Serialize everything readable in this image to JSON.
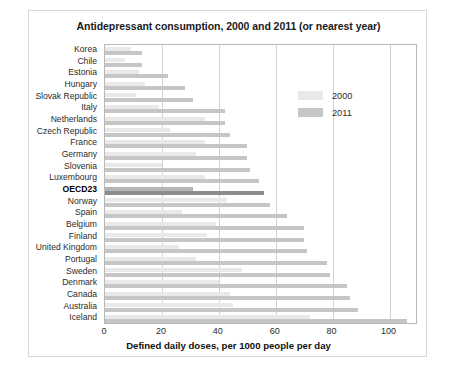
{
  "chart_data": {
    "type": "bar",
    "orientation": "horizontal",
    "title": "Antidepressant consumption, 2000 and 2011 (or nearest year)",
    "xlabel": "Defined daily doses, per 1000 people per day",
    "ylabel": "",
    "xlim": [
      0,
      110
    ],
    "xticks": [
      0,
      20,
      40,
      60,
      80,
      100
    ],
    "grid": "vertical",
    "legend_position": "upper-right-inside",
    "highlight_category": "OECD23",
    "categories": [
      "Korea",
      "Chile",
      "Estonia",
      "Hungary",
      "Slovak Republic",
      "Italy",
      "Netherlands",
      "Czech Republic",
      "France",
      "Germany",
      "Slovenia",
      "Luxembourg",
      "OECD23",
      "Norway",
      "Spain",
      "Belgium",
      "Finland",
      "United Kingdom",
      "Portugal",
      "Sweden",
      "Denmark",
      "Canada",
      "Australia",
      "Iceland"
    ],
    "series": [
      {
        "name": "2000",
        "color": "#e9e9e9",
        "values": [
          9,
          7,
          12,
          14,
          11,
          19,
          35,
          23,
          35,
          32,
          20,
          35,
          31,
          43,
          27,
          39,
          36,
          26,
          32,
          48,
          40,
          44,
          45,
          72
        ]
      },
      {
        "name": "2011",
        "color": "#c6c6c6",
        "values": [
          13,
          13,
          22,
          28,
          31,
          42,
          42,
          44,
          50,
          50,
          51,
          54,
          56,
          58,
          64,
          70,
          70,
          71,
          78,
          79,
          85,
          86,
          89,
          106
        ]
      }
    ]
  },
  "legend": {
    "items": [
      {
        "label": "2000"
      },
      {
        "label": "2011"
      }
    ]
  }
}
